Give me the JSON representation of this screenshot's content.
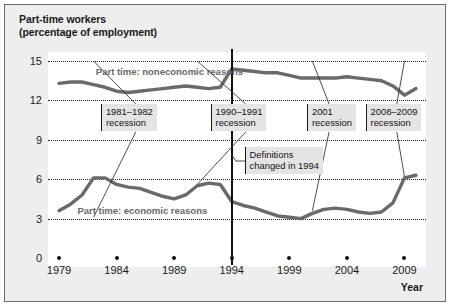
{
  "figure": {
    "title_lines": [
      "Part-time workers",
      "(percentage of employment)"
    ],
    "xaxis_title": "Year",
    "border_color": "#6d6d6d",
    "background_color": "#eeeeee",
    "plot_background_color": "#ffffff",
    "series_color": "#6a6a6a",
    "gridline_color": "#2b2b2b"
  },
  "chart_data": {
    "type": "line",
    "title": "Part-time workers (percentage of employment)",
    "subtitle": "",
    "xlabel": "Year",
    "ylabel": "percentage of employment",
    "xlim": [
      1979,
      2010
    ],
    "ylim": [
      0,
      15
    ],
    "ytick_labels": [
      "0",
      "3",
      "6",
      "9",
      "12",
      "15"
    ],
    "ytick_values": [
      0,
      3,
      6,
      9,
      12,
      15
    ],
    "xtick_labels": [
      "1979",
      "1984",
      "1989",
      "1994",
      "1999",
      "2004",
      "2009"
    ],
    "xtick_values": [
      1979,
      1984,
      1989,
      1994,
      1999,
      2004,
      2009
    ],
    "grid": "horizontal-dotted",
    "legend": "inline-labels",
    "series": [
      {
        "name": "Part time: noneconomic reasons",
        "label_text": "Part time: noneconomic reasons",
        "x": [
          1979,
          1980,
          1981,
          1982,
          1983,
          1984,
          1985,
          1986,
          1987,
          1988,
          1989,
          1990,
          1991,
          1992,
          1993,
          1994,
          1995,
          1996,
          1997,
          1998,
          1999,
          2000,
          2001,
          2002,
          2003,
          2004,
          2005,
          2006,
          2007,
          2008,
          2009,
          2010
        ],
        "values": [
          13.3,
          13.4,
          13.4,
          13.2,
          13.0,
          12.7,
          12.6,
          12.7,
          12.8,
          12.9,
          13.0,
          13.1,
          13.0,
          12.9,
          13.0,
          14.4,
          14.3,
          14.2,
          14.1,
          14.1,
          13.9,
          13.7,
          13.7,
          13.7,
          13.7,
          13.8,
          13.7,
          13.6,
          13.5,
          13.1,
          12.4,
          12.9
        ]
      },
      {
        "name": "Part time: economic reasons",
        "label_text": "Part time: economic reasons",
        "x": [
          1979,
          1980,
          1981,
          1982,
          1983,
          1984,
          1985,
          1986,
          1987,
          1988,
          1989,
          1990,
          1991,
          1992,
          1993,
          1994,
          1995,
          1996,
          1997,
          1998,
          1999,
          2000,
          2001,
          2002,
          2003,
          2004,
          2005,
          2006,
          2007,
          2008,
          2009,
          2010
        ],
        "values": [
          3.6,
          4.1,
          4.8,
          6.1,
          6.1,
          5.6,
          5.4,
          5.3,
          5.0,
          4.7,
          4.5,
          4.8,
          5.5,
          5.7,
          5.6,
          4.3,
          4.0,
          3.8,
          3.5,
          3.2,
          3.1,
          3.0,
          3.4,
          3.7,
          3.8,
          3.7,
          3.5,
          3.4,
          3.5,
          4.2,
          6.1,
          6.3
        ]
      }
    ],
    "annotations": [
      {
        "id": "recession-1981-1982",
        "lines": [
          "1981–1982",
          "recession"
        ],
        "target_x": 1982,
        "box_left_pct": 14.0,
        "box_top_pct": 24.0
      },
      {
        "id": "recession-1990-1991",
        "lines": [
          "1990–1991",
          "recession"
        ],
        "target_x": 1991,
        "box_left_pct": 43.0,
        "box_top_pct": 24.0
      },
      {
        "id": "recession-2001",
        "lines": [
          "2001",
          "recession"
        ],
        "target_x": 2001,
        "box_left_pct": 68.5,
        "box_top_pct": 24.0
      },
      {
        "id": "recession-2008-2009",
        "lines": [
          "2008–2009",
          "recession"
        ],
        "target_x": 2009,
        "box_left_pct": 84.0,
        "box_top_pct": 24.0
      },
      {
        "id": "definitions-changed",
        "lines": [
          "Definitions",
          "changed in 1994"
        ],
        "target_x": 1994,
        "box_left_pct": 52.0,
        "box_top_pct": 44.0
      }
    ],
    "vertical_marker": {
      "id": "definitions-change-divider",
      "x": 1994,
      "label": "Definitions changed in 1994"
    }
  }
}
